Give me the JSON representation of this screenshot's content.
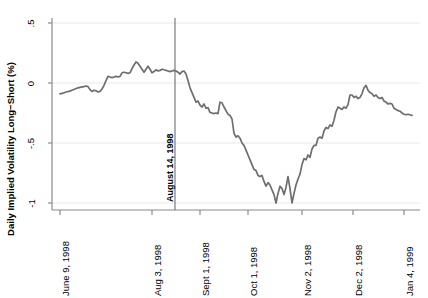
{
  "chart_data": {
    "type": "line",
    "title": "",
    "xlabel": "",
    "ylabel": "Daily Implied Volatility Long−Short (%)",
    "ylim": [
      -1.15,
      0.6
    ],
    "yticks": [
      0.5,
      0,
      -0.5,
      -1
    ],
    "ytick_labels": [
      ".5",
      "0",
      "-.5",
      "-1"
    ],
    "grid": true,
    "grid_axis": "y",
    "legend": "none",
    "line_color": "#6e6e6e",
    "xtick_labels": [
      "June 9, 1998",
      "Aug 3, 1998",
      "Sept 1, 1998",
      "Oct 1, 1998",
      "Nov 2, 1998",
      "Dec 2, 1998",
      "Jan 4, 1999"
    ],
    "xtick_positions": [
      60,
      152,
      200,
      248,
      302,
      353,
      404
    ],
    "annotations": [
      {
        "text": "August 14, 1998",
        "type": "vertical-line",
        "x_position": 175,
        "color": "#6e6e6e"
      }
    ],
    "series": [
      {
        "name": "Daily Implied Volatility Long-Short",
        "points": [
          [
            60,
            -0.09
          ],
          [
            63,
            -0.085
          ],
          [
            66,
            -0.075
          ],
          [
            69,
            -0.07
          ],
          [
            72,
            -0.06
          ],
          [
            75,
            -0.05
          ],
          [
            78,
            -0.04
          ],
          [
            81,
            -0.035
          ],
          [
            84,
            -0.03
          ],
          [
            86,
            -0.025
          ],
          [
            88,
            -0.03
          ],
          [
            90,
            -0.055
          ],
          [
            92,
            -0.07
          ],
          [
            94,
            -0.06
          ],
          [
            96,
            -0.065
          ],
          [
            98,
            -0.075
          ],
          [
            100,
            -0.07
          ],
          [
            102,
            -0.05
          ],
          [
            104,
            -0.02
          ],
          [
            106,
            0.02
          ],
          [
            108,
            0.055
          ],
          [
            110,
            0.05
          ],
          [
            112,
            0.045
          ],
          [
            114,
            0.05
          ],
          [
            116,
            0.055
          ],
          [
            118,
            0.05
          ],
          [
            120,
            0.055
          ],
          [
            122,
            0.085
          ],
          [
            124,
            0.09
          ],
          [
            126,
            0.085
          ],
          [
            128,
            0.08
          ],
          [
            130,
            0.085
          ],
          [
            132,
            0.12
          ],
          [
            134,
            0.15
          ],
          [
            136,
            0.175
          ],
          [
            138,
            0.165
          ],
          [
            140,
            0.14
          ],
          [
            142,
            0.115
          ],
          [
            144,
            0.09
          ],
          [
            146,
            0.115
          ],
          [
            148,
            0.14
          ],
          [
            150,
            0.115
          ],
          [
            152,
            0.085
          ],
          [
            154,
            0.095
          ],
          [
            156,
            0.11
          ],
          [
            158,
            0.1
          ],
          [
            160,
            0.105
          ],
          [
            162,
            0.115
          ],
          [
            164,
            0.11
          ],
          [
            166,
            0.105
          ],
          [
            168,
            0.1
          ],
          [
            170,
            0.095
          ],
          [
            172,
            0.1
          ],
          [
            174,
            0.105
          ],
          [
            176,
            0.1
          ],
          [
            178,
            0.09
          ],
          [
            180,
            0.075
          ],
          [
            182,
            0.095
          ],
          [
            184,
            0.1
          ],
          [
            186,
            0.075
          ],
          [
            188,
            0.02
          ],
          [
            190,
            -0.04
          ],
          [
            192,
            -0.08
          ],
          [
            194,
            -0.12
          ],
          [
            196,
            -0.16
          ],
          [
            198,
            -0.15
          ],
          [
            200,
            -0.185
          ],
          [
            202,
            -0.2
          ],
          [
            204,
            -0.175
          ],
          [
            206,
            -0.21
          ],
          [
            208,
            -0.205
          ],
          [
            210,
            -0.245
          ],
          [
            212,
            -0.25
          ],
          [
            214,
            -0.255
          ],
          [
            216,
            -0.25
          ],
          [
            218,
            -0.255
          ],
          [
            220,
            -0.16
          ],
          [
            222,
            -0.165
          ],
          [
            224,
            -0.2
          ],
          [
            226,
            -0.23
          ],
          [
            228,
            -0.26
          ],
          [
            230,
            -0.27
          ],
          [
            232,
            -0.3
          ],
          [
            234,
            -0.42
          ],
          [
            236,
            -0.45
          ],
          [
            238,
            -0.44
          ],
          [
            240,
            -0.46
          ],
          [
            242,
            -0.5
          ],
          [
            244,
            -0.52
          ],
          [
            246,
            -0.56
          ],
          [
            248,
            -0.6
          ],
          [
            250,
            -0.64
          ],
          [
            252,
            -0.68
          ],
          [
            254,
            -0.72
          ],
          [
            256,
            -0.73
          ],
          [
            258,
            -0.77
          ],
          [
            260,
            -0.78
          ],
          [
            262,
            -0.77
          ],
          [
            264,
            -0.82
          ],
          [
            266,
            -0.86
          ],
          [
            268,
            -0.83
          ],
          [
            270,
            -0.85
          ],
          [
            272,
            -0.89
          ],
          [
            274,
            -0.93
          ],
          [
            276,
            -1.0
          ],
          [
            278,
            -0.92
          ],
          [
            280,
            -0.86
          ],
          [
            282,
            -0.88
          ],
          [
            284,
            -0.93
          ],
          [
            286,
            -0.87
          ],
          [
            288,
            -0.78
          ],
          [
            290,
            -0.88
          ],
          [
            292,
            -1.0
          ],
          [
            294,
            -0.92
          ],
          [
            296,
            -0.85
          ],
          [
            298,
            -0.8
          ],
          [
            300,
            -0.76
          ],
          [
            302,
            -0.68
          ],
          [
            304,
            -0.63
          ],
          [
            306,
            -0.64
          ],
          [
            308,
            -0.6
          ],
          [
            310,
            -0.62
          ],
          [
            312,
            -0.55
          ],
          [
            314,
            -0.52
          ],
          [
            316,
            -0.52
          ],
          [
            318,
            -0.46
          ],
          [
            320,
            -0.45
          ],
          [
            322,
            -0.46
          ],
          [
            324,
            -0.4
          ],
          [
            326,
            -0.37
          ],
          [
            328,
            -0.38
          ],
          [
            330,
            -0.35
          ],
          [
            332,
            -0.36
          ],
          [
            334,
            -0.31
          ],
          [
            336,
            -0.24
          ],
          [
            338,
            -0.2
          ],
          [
            340,
            -0.21
          ],
          [
            342,
            -0.22
          ],
          [
            344,
            -0.2
          ],
          [
            346,
            -0.21
          ],
          [
            348,
            -0.18
          ],
          [
            350,
            -0.1
          ],
          [
            352,
            -0.1
          ],
          [
            354,
            -0.12
          ],
          [
            356,
            -0.11
          ],
          [
            358,
            -0.13
          ],
          [
            360,
            -0.12
          ],
          [
            362,
            -0.09
          ],
          [
            364,
            -0.04
          ],
          [
            366,
            -0.02
          ],
          [
            368,
            -0.06
          ],
          [
            370,
            -0.08
          ],
          [
            372,
            -0.09
          ],
          [
            374,
            -0.11
          ],
          [
            376,
            -0.1
          ],
          [
            378,
            -0.12
          ],
          [
            380,
            -0.13
          ],
          [
            382,
            -0.12
          ],
          [
            384,
            -0.15
          ],
          [
            386,
            -0.16
          ],
          [
            388,
            -0.175
          ],
          [
            390,
            -0.17
          ],
          [
            392,
            -0.175
          ],
          [
            394,
            -0.21
          ],
          [
            396,
            -0.22
          ],
          [
            398,
            -0.23
          ],
          [
            400,
            -0.235
          ],
          [
            402,
            -0.25
          ],
          [
            404,
            -0.26
          ],
          [
            406,
            -0.265
          ],
          [
            408,
            -0.26
          ],
          [
            410,
            -0.265
          ],
          [
            412,
            -0.27
          ]
        ]
      }
    ]
  },
  "plot_geometry": {
    "left": 52,
    "right": 420,
    "top": 18,
    "bottom": 210
  }
}
